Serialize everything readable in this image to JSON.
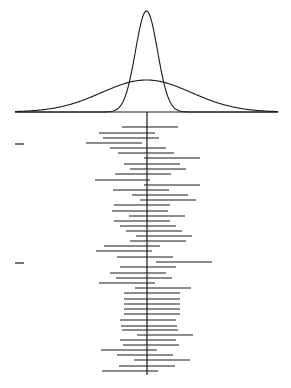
{
  "figure": {
    "width": 291,
    "height": 388,
    "stroke_color": "#1a1a1a",
    "background": "#ffffff"
  },
  "distributions": {
    "baseline": {
      "x1": 15,
      "x2": 278,
      "y": 112
    },
    "center_x": 146.5,
    "narrow": {
      "peak_y": 11,
      "sigma_px": 11
    },
    "wide": {
      "peak_y": 80,
      "sigma_px": 45
    }
  },
  "center_line": {
    "x": 147,
    "y1": 112,
    "y2": 375
  },
  "left_ticks": [
    {
      "y": 144,
      "x1": 15,
      "x2": 24
    },
    {
      "y": 263,
      "x1": 15,
      "x2": 24
    }
  ],
  "intervals": [
    {
      "y": 127,
      "x1": 122,
      "x2": 178
    },
    {
      "y": 133,
      "x1": 99,
      "x2": 155
    },
    {
      "y": 138,
      "x1": 103,
      "x2": 159
    },
    {
      "y": 143,
      "x1": 86,
      "x2": 142
    },
    {
      "y": 148,
      "x1": 110,
      "x2": 166
    },
    {
      "y": 153,
      "x1": 118,
      "x2": 174
    },
    {
      "y": 158,
      "x1": 144,
      "x2": 200
    },
    {
      "y": 164,
      "x1": 124,
      "x2": 180
    },
    {
      "y": 169,
      "x1": 130,
      "x2": 186
    },
    {
      "y": 174,
      "x1": 115,
      "x2": 171
    },
    {
      "y": 180,
      "x1": 95,
      "x2": 150
    },
    {
      "y": 185,
      "x1": 144,
      "x2": 200
    },
    {
      "y": 190,
      "x1": 113,
      "x2": 169
    },
    {
      "y": 195,
      "x1": 132,
      "x2": 188
    },
    {
      "y": 200,
      "x1": 140,
      "x2": 196
    },
    {
      "y": 205,
      "x1": 114,
      "x2": 170
    },
    {
      "y": 211,
      "x1": 112,
      "x2": 168
    },
    {
      "y": 216,
      "x1": 129,
      "x2": 185
    },
    {
      "y": 221,
      "x1": 114,
      "x2": 170
    },
    {
      "y": 226,
      "x1": 120,
      "x2": 176
    },
    {
      "y": 231,
      "x1": 126,
      "x2": 182
    },
    {
      "y": 236,
      "x1": 136,
      "x2": 192
    },
    {
      "y": 241,
      "x1": 130,
      "x2": 186
    },
    {
      "y": 246,
      "x1": 104,
      "x2": 160
    },
    {
      "y": 251,
      "x1": 96,
      "x2": 152
    },
    {
      "y": 257,
      "x1": 117,
      "x2": 173
    },
    {
      "y": 262,
      "x1": 156,
      "x2": 212
    },
    {
      "y": 267,
      "x1": 120,
      "x2": 176
    },
    {
      "y": 273,
      "x1": 110,
      "x2": 166
    },
    {
      "y": 278,
      "x1": 116,
      "x2": 172
    },
    {
      "y": 283,
      "x1": 99,
      "x2": 155
    },
    {
      "y": 288,
      "x1": 135,
      "x2": 191
    },
    {
      "y": 293,
      "x1": 124,
      "x2": 180
    },
    {
      "y": 299,
      "x1": 124,
      "x2": 180
    },
    {
      "y": 304,
      "x1": 124,
      "x2": 180
    },
    {
      "y": 309,
      "x1": 124,
      "x2": 180
    },
    {
      "y": 314,
      "x1": 124,
      "x2": 180
    },
    {
      "y": 320,
      "x1": 120,
      "x2": 176
    },
    {
      "y": 326,
      "x1": 121,
      "x2": 177
    },
    {
      "y": 330,
      "x1": 122,
      "x2": 178
    },
    {
      "y": 335,
      "x1": 137,
      "x2": 193
    },
    {
      "y": 340,
      "x1": 120,
      "x2": 176
    },
    {
      "y": 345,
      "x1": 123,
      "x2": 179
    },
    {
      "y": 350,
      "x1": 101,
      "x2": 157
    },
    {
      "y": 355,
      "x1": 117,
      "x2": 173
    },
    {
      "y": 360,
      "x1": 134,
      "x2": 190
    },
    {
      "y": 366,
      "x1": 119,
      "x2": 175
    },
    {
      "y": 371,
      "x1": 102,
      "x2": 158
    }
  ]
}
